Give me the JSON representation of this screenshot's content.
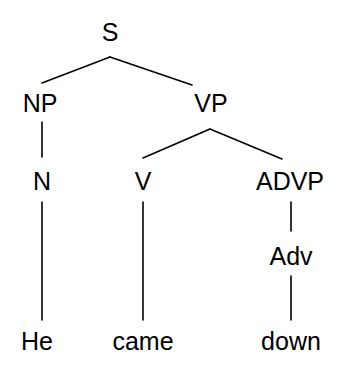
{
  "diagram": {
    "type": "constituency-parse-tree",
    "sentence": "He came down",
    "background_color": "#ffffff",
    "line_color": "#000000",
    "text_color": "#000000",
    "nodes": [
      {
        "id": "S",
        "label": "S",
        "x": 110,
        "y": 32,
        "kind": "nonterminal"
      },
      {
        "id": "NP",
        "label": "NP",
        "x": 40,
        "y": 103,
        "kind": "nonterminal"
      },
      {
        "id": "VP",
        "label": "VP",
        "x": 211,
        "y": 103,
        "kind": "nonterminal"
      },
      {
        "id": "N",
        "label": "N",
        "x": 42,
        "y": 181,
        "kind": "nonterminal"
      },
      {
        "id": "V",
        "label": "V",
        "x": 143,
        "y": 181,
        "kind": "nonterminal"
      },
      {
        "id": "ADVP",
        "label": "ADVP",
        "x": 290,
        "y": 181,
        "kind": "nonterminal"
      },
      {
        "id": "Adv",
        "label": "Adv",
        "x": 291,
        "y": 256,
        "kind": "nonterminal"
      },
      {
        "id": "He",
        "label": "He",
        "x": 37,
        "y": 341,
        "kind": "terminal"
      },
      {
        "id": "came",
        "label": "came",
        "x": 143,
        "y": 341,
        "kind": "terminal"
      },
      {
        "id": "down",
        "label": "down",
        "x": 291,
        "y": 341,
        "kind": "terminal"
      }
    ],
    "edges": [
      {
        "from": "S",
        "to": "NP",
        "x1": 110,
        "y1": 57,
        "x2": 42,
        "y2": 83
      },
      {
        "from": "S",
        "to": "VP",
        "x1": 110,
        "y1": 57,
        "x2": 192,
        "y2": 85
      },
      {
        "from": "NP",
        "to": "N",
        "x1": 42,
        "y1": 122,
        "x2": 42,
        "y2": 157
      },
      {
        "from": "VP",
        "to": "V",
        "x1": 210,
        "y1": 129,
        "x2": 143,
        "y2": 158
      },
      {
        "from": "VP",
        "to": "ADVP",
        "x1": 210,
        "y1": 129,
        "x2": 282,
        "y2": 159
      },
      {
        "from": "N",
        "to": "He",
        "x1": 42,
        "y1": 202,
        "x2": 42,
        "y2": 320
      },
      {
        "from": "V",
        "to": "came",
        "x1": 143,
        "y1": 202,
        "x2": 143,
        "y2": 320
      },
      {
        "from": "ADVP",
        "to": "Adv",
        "x1": 291,
        "y1": 202,
        "x2": 291,
        "y2": 231
      },
      {
        "from": "Adv",
        "to": "down",
        "x1": 291,
        "y1": 276,
        "x2": 291,
        "y2": 320
      }
    ]
  }
}
